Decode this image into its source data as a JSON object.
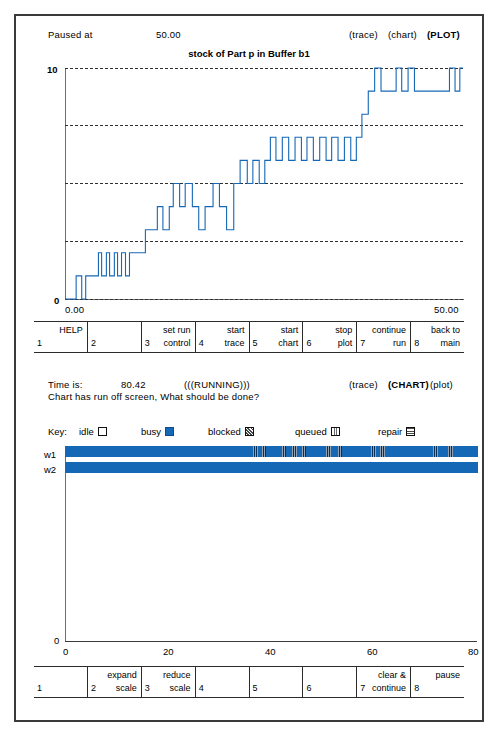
{
  "plot_panel": {
    "status_label": "Paused at",
    "status_time": "50.00",
    "mode_trace": "(trace)",
    "mode_chart": "(chart)",
    "mode_plot": "(PLOT)",
    "title": "stock of Part p in Buffer b1",
    "y_top_label": "10",
    "y_bottom_label": "0",
    "x_left_label": "0.00",
    "x_right_label": "50.00",
    "fkeys": [
      {
        "num": "1",
        "line1": "HELP",
        "line2": ""
      },
      {
        "num": "2",
        "line1": "",
        "line2": ""
      },
      {
        "num": "3",
        "line1": "set run",
        "line2": "control"
      },
      {
        "num": "4",
        "line1": "start",
        "line2": "trace"
      },
      {
        "num": "5",
        "line1": "start",
        "line2": "chart"
      },
      {
        "num": "6",
        "line1": "stop",
        "line2": "plot"
      },
      {
        "num": "7",
        "line1": "continue",
        "line2": "run"
      },
      {
        "num": "8",
        "line1": "back to",
        "line2": "main"
      }
    ]
  },
  "chart_panel": {
    "time_label": "Time is:",
    "time_value": "80.42",
    "run_state": "(((RUNNING)))",
    "mode_trace": "(trace)",
    "mode_chart": "(CHART)",
    "mode_plot": "(plot)",
    "message": "Chart has run off screen,  What should be done?",
    "key_label": "Key:",
    "key_items": [
      {
        "label": "idle",
        "swatch": "idle-swatch"
      },
      {
        "label": "busy",
        "swatch": "busy-swatch"
      },
      {
        "label": "blocked",
        "swatch": "blocked-swatch"
      },
      {
        "label": "queued",
        "swatch": "queued-swatch"
      },
      {
        "label": "repair",
        "swatch": "repair-swatch"
      }
    ],
    "y_zero_label": "0",
    "fkeys": [
      {
        "num": "1",
        "line1": "",
        "line2": ""
      },
      {
        "num": "2",
        "line1": "expand",
        "line2": "scale"
      },
      {
        "num": "3",
        "line1": "reduce",
        "line2": "scale"
      },
      {
        "num": "4",
        "line1": "",
        "line2": ""
      },
      {
        "num": "5",
        "line1": "",
        "line2": ""
      },
      {
        "num": "6",
        "line1": "",
        "line2": ""
      },
      {
        "num": "7",
        "line1": "clear &",
        "line2": "continue"
      },
      {
        "num": "8",
        "line1": "pause",
        "line2": ""
      }
    ]
  },
  "chart_data": [
    {
      "type": "line",
      "subtype": "step",
      "title": "stock of Part p in Buffer b1",
      "xlabel": "",
      "ylabel": "",
      "xlim": [
        0.0,
        50.0
      ],
      "ylim": [
        0,
        10
      ],
      "xticks": [
        0.0,
        50.0
      ],
      "xticklabels": [
        "0.00",
        "50.00"
      ],
      "yticks": [
        0,
        2.5,
        5,
        7.5,
        10
      ],
      "yticklabels": [
        "0",
        "",
        "",
        "",
        "10"
      ],
      "grid": "horizontal-dashed",
      "legend": "none",
      "line_color": "#1568b5",
      "series": [
        {
          "name": "stock of Part p in Buffer b1",
          "x": [
            0.0,
            1.4,
            1.4,
            2.1,
            2.1,
            2.6,
            2.6,
            4.2,
            4.2,
            4.6,
            4.6,
            5.2,
            5.2,
            5.6,
            5.6,
            6.2,
            6.2,
            6.6,
            6.6,
            7.1,
            7.1,
            7.6,
            7.6,
            8.1,
            8.1,
            10.1,
            10.1,
            11.6,
            11.6,
            12.3,
            12.3,
            13.1,
            13.1,
            13.6,
            13.6,
            14.4,
            14.4,
            15.1,
            15.1,
            16.0,
            16.0,
            16.8,
            16.8,
            17.6,
            17.6,
            18.6,
            18.6,
            19.4,
            19.4,
            20.3,
            20.3,
            21.2,
            21.2,
            22.0,
            22.0,
            22.9,
            22.9,
            23.6,
            23.6,
            24.4,
            24.4,
            25.1,
            25.1,
            25.8,
            25.8,
            26.5,
            26.5,
            27.3,
            27.3,
            28.1,
            28.1,
            28.9,
            28.9,
            29.7,
            29.7,
            30.4,
            30.4,
            31.2,
            31.2,
            32.0,
            32.0,
            32.8,
            32.8,
            33.5,
            33.5,
            34.3,
            34.3,
            35.1,
            35.1,
            35.9,
            35.9,
            36.6,
            36.6,
            37.3,
            37.3,
            38.1,
            38.1,
            38.9,
            38.9,
            39.7,
            39.7,
            41.6,
            41.6,
            42.3,
            42.3,
            43.1,
            43.1,
            43.9,
            43.9,
            48.3,
            48.3,
            49.0,
            49.0,
            49.6,
            49.6,
            50.0
          ],
          "y": [
            0,
            0,
            1,
            1,
            0,
            0,
            1,
            1,
            2,
            2,
            1,
            1,
            2,
            2,
            1,
            1,
            2,
            2,
            1,
            1,
            2,
            2,
            1,
            1,
            2,
            2,
            3,
            3,
            4,
            4,
            3,
            3,
            4,
            4,
            5,
            5,
            4,
            4,
            5,
            5,
            4,
            4,
            3,
            3,
            4,
            4,
            5,
            5,
            4,
            4,
            3,
            3,
            5,
            5,
            6,
            6,
            5,
            5,
            6,
            6,
            5,
            5,
            6,
            6,
            7,
            7,
            6,
            6,
            7,
            7,
            6,
            6,
            7,
            7,
            6,
            6,
            7,
            7,
            6,
            6,
            7,
            7,
            6,
            6,
            7,
            7,
            6,
            6,
            7,
            7,
            6,
            6,
            7,
            7,
            8,
            8,
            9,
            9,
            10,
            10,
            9,
            9,
            10,
            10,
            9,
            9,
            10,
            10,
            9,
            9,
            10,
            10,
            9,
            9,
            10,
            10,
            9
          ]
        }
      ]
    },
    {
      "type": "gantt",
      "title": "",
      "xlabel": "",
      "ylabel": "",
      "xlim": [
        0,
        80
      ],
      "xticks": [
        0,
        20,
        40,
        60,
        80
      ],
      "xticklabels": [
        "0",
        "20",
        "40",
        "60",
        "80"
      ],
      "categories": [
        "w1",
        "w2"
      ],
      "state_colors": {
        "idle": "#ffffff",
        "busy": "#1568b5",
        "blocked": "#0b2f52",
        "queued": "#5a7a95",
        "repair": "#3a3a3a"
      },
      "rows": [
        {
          "label": "w1",
          "segments": [
            {
              "state": "busy",
              "start": 0.0,
              "end": 80.42
            },
            {
              "state": "blocked",
              "start": 36.6,
              "end": 37.5
            },
            {
              "state": "blocked",
              "start": 38.3,
              "end": 39.2
            },
            {
              "state": "blocked",
              "start": 42.2,
              "end": 43.1
            },
            {
              "state": "blocked",
              "start": 44.2,
              "end": 45.1
            },
            {
              "state": "blocked",
              "start": 46.1,
              "end": 47.0
            },
            {
              "state": "blocked",
              "start": 50.8,
              "end": 51.8
            },
            {
              "state": "blocked",
              "start": 53.2,
              "end": 54.0
            },
            {
              "state": "blocked",
              "start": 59.6,
              "end": 60.6
            },
            {
              "state": "blocked",
              "start": 61.4,
              "end": 62.3
            },
            {
              "state": "blocked",
              "start": 71.7,
              "end": 72.6
            },
            {
              "state": "blocked",
              "start": 74.6,
              "end": 75.6
            }
          ]
        },
        {
          "label": "w2",
          "segments": [
            {
              "state": "busy",
              "start": 0.0,
              "end": 80.42
            }
          ]
        }
      ]
    }
  ]
}
